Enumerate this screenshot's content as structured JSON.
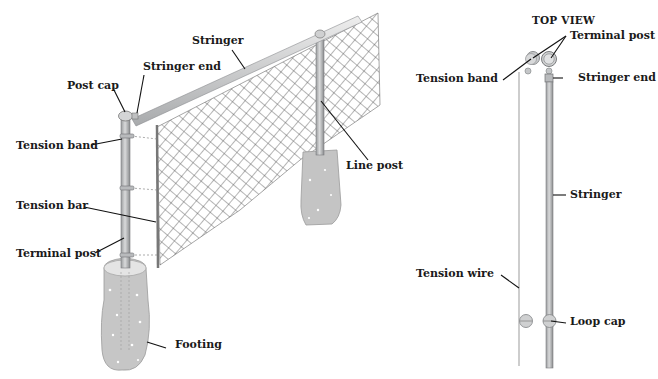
{
  "diagram": {
    "perspective_view": {
      "labels": {
        "stringer": "Stringer",
        "stringer_end": "Stringer end",
        "post_cap": "Post cap",
        "tension_band": "Tension band",
        "tension_bar": "Tension bar",
        "terminal_post": "Terminal post",
        "footing": "Footing",
        "line_post": "Line post"
      }
    },
    "top_view": {
      "title": "TOP VIEW",
      "labels": {
        "terminal_post": "Terminal post",
        "tension_band": "Tension band",
        "stringer_end": "Stringer end",
        "stringer": "Stringer",
        "tension_wire": "Tension wire",
        "loop_cap": "Loop cap"
      }
    },
    "colors": {
      "metal": "#c9cbcc",
      "metal_dark": "#8f9193",
      "concrete": "#c6c6c6",
      "mesh": "#555555",
      "leader": "#111111"
    }
  }
}
